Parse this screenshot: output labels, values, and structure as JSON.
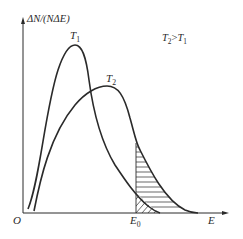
{
  "diagram": {
    "axes": {
      "y_label": "ΔN/(NΔE)",
      "x_label": "E",
      "origin_label": "O"
    },
    "curves": [
      {
        "name": "T1",
        "label_main": "T",
        "label_sub": "1",
        "description": "lower temperature, taller narrower peak"
      },
      {
        "name": "T2",
        "label_main": "T",
        "label_sub": "2",
        "description": "higher temperature, lower broader peak"
      }
    ],
    "condition": {
      "left_main": "T",
      "left_sub": "2",
      "op": ">",
      "right_main": "T",
      "right_sub": "1"
    },
    "threshold": {
      "label_main": "E",
      "label_sub": "0",
      "description": "activation energy; shaded areas right of E0 show fraction of molecules with E ≥ E0"
    },
    "shading": {
      "T2_region": "horizontal hatching",
      "T1_region": "diagonal hatching"
    },
    "colors": {
      "line": "#2a2a2a",
      "background": "#ffffff"
    }
  }
}
